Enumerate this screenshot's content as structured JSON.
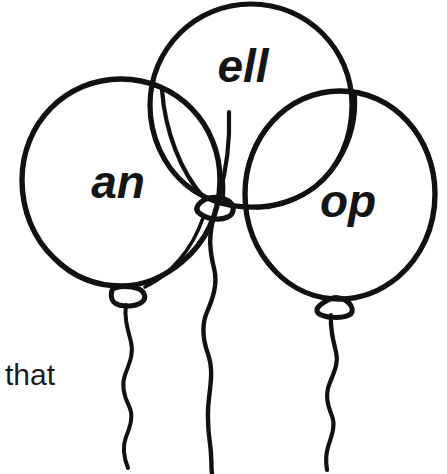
{
  "page": {
    "background_color": "#ffffff",
    "ink_color": "#111111",
    "width": 447,
    "height": 474
  },
  "caption": {
    "text": "that",
    "x": 5,
    "y": 385,
    "font_size": 30
  },
  "balloons": [
    {
      "id": "left",
      "label": "an",
      "label_x": 118,
      "label_y": 186,
      "label_font_size": 46,
      "center_x": 121,
      "center_y": 186,
      "radius": 99,
      "knot_x": 125,
      "knot_y": 300,
      "string_bottom_y": 470
    },
    {
      "id": "middle",
      "label": "ell",
      "label_x": 243,
      "label_y": 70,
      "label_font_size": 46,
      "center_x": 251,
      "center_y": 105,
      "radius": 101,
      "knot_x": 212,
      "knot_y": 206,
      "string_bottom_y": 474
    },
    {
      "id": "right",
      "label": "op",
      "label_x": 348,
      "label_y": 205,
      "label_font_size": 46,
      "center_x": 340,
      "center_y": 196,
      "radius": 97,
      "knot_x": 330,
      "knot_y": 305,
      "string_bottom_y": 470
    }
  ]
}
